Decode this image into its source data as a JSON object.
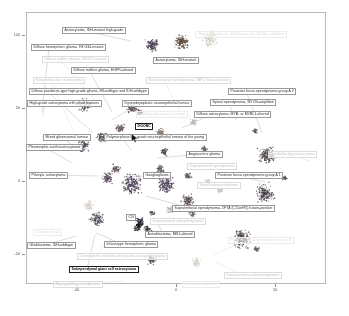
{
  "figure": {
    "type": "scatter-umap",
    "background": "#ffffff",
    "frame_color": "#b9b9b9"
  },
  "chart_data": {
    "type": "scatter",
    "title": "",
    "xlabel": "",
    "ylabel": "",
    "xlim": [
      -75,
      75
    ],
    "ylim": [
      -70,
      115
    ],
    "grid": false,
    "legend": "none",
    "xticks": [
      "-50",
      "0",
      "50"
    ],
    "yticks": [
      "100",
      "50",
      "0",
      "-50"
    ],
    "clusters": [
      {
        "name": "Astrocytoma, IDH-mutant high-grade",
        "x": -12,
        "y": 93,
        "color": "#4a3f52",
        "n": 120,
        "spread": 7
      },
      {
        "name": "Astrocytoma, IDH-mutant",
        "x": 3,
        "y": 95,
        "color": "#5b4a3e",
        "n": 130,
        "spread": 8
      },
      {
        "name": "Oligodendroglioma, IDH-mutant and 1p/19q-codeleted",
        "x": 17,
        "y": 97,
        "color": "#c9c2b4",
        "n": 110,
        "spread": 8
      },
      {
        "name": "Diffuse hemispheric glioma, H3 G34-mutant",
        "x": -46,
        "y": 52,
        "color": "#4d4150",
        "n": 95,
        "spread": 7
      },
      {
        "name": "Diffuse midline glioma, H3 K27-altered",
        "x": -22,
        "y": 50,
        "color": "#5f5158",
        "n": 85,
        "spread": 6
      },
      {
        "name": "Diffuse midline glioma, EGFR-altered",
        "x": -18,
        "y": 47,
        "color": "#6d5a5f",
        "n": 40,
        "spread": 3
      },
      {
        "name": "Extraventricular neurocytoma",
        "x": -28,
        "y": 36,
        "color": "#6a5b66",
        "n": 60,
        "spread": 5
      },
      {
        "name": "Diffuse paediatric-type high-grade glioma, H3-wildtype and IDH-wildtype",
        "x": -37,
        "y": 30,
        "color": "#564a58",
        "n": 70,
        "spread": 6
      },
      {
        "name": "High-grade astrocytoma with piloid features",
        "x": -47,
        "y": 24,
        "color": "#4e4354",
        "n": 90,
        "spread": 7
      },
      {
        "name": "Dysembryoplastic neuroepithelial tumour",
        "x": -8,
        "y": 33,
        "color": "#7a6a5e",
        "n": 55,
        "spread": 5
      },
      {
        "name": "Papillary glioneuronal tumour",
        "x": 2,
        "y": 30,
        "color": "#d6cfc4",
        "n": 35,
        "spread": 4
      },
      {
        "name": "DGONC",
        "x": -6,
        "y": 20,
        "color": "#4a4050",
        "n": 45,
        "spread": 4
      },
      {
        "name": "Supratentorial ependymoma, YAP1 fusion-positive",
        "x": 9,
        "y": 40,
        "color": "#bdb5ad",
        "n": 40,
        "spread": 4
      },
      {
        "name": "Diffuse astrocytoma, MYB- or MYBL1-altered",
        "x": 14,
        "y": 22,
        "color": "#6c5f5a",
        "n": 35,
        "spread": 4
      },
      {
        "name": "Spinal ependymoma, MYCN-amplified",
        "x": 40,
        "y": 34,
        "color": "#5d5150",
        "n": 30,
        "spread": 3
      },
      {
        "name": "Posterior fossa ependymoma group A 2",
        "x": 46,
        "y": 18,
        "color": "#4f4549",
        "n": 160,
        "spread": 10
      },
      {
        "name": "Mixed glioneuronal tumour",
        "x": -30,
        "y": 8,
        "color": "#5d4f5c",
        "n": 55,
        "spread": 5
      },
      {
        "name": "Polymorphous low-grade neuroepithelial tumour of the young",
        "x": -8,
        "y": 8,
        "color": "#6a5a63",
        "n": 50,
        "spread": 5
      },
      {
        "name": "Pleomorphic xanthoastrocytoma",
        "x": -34,
        "y": 2,
        "color": "#5a4e5a",
        "n": 80,
        "spread": 6
      },
      {
        "name": "Pilocytic astrocytoma",
        "x": -22,
        "y": -2,
        "color": "#50455a",
        "n": 200,
        "spread": 11
      },
      {
        "name": "Ganglioglioma",
        "x": -5,
        "y": -3,
        "color": "#4b4158",
        "n": 150,
        "spread": 9
      },
      {
        "name": "Angiocentric glioma",
        "x": 6,
        "y": 3,
        "color": "#635660",
        "n": 45,
        "spread": 4
      },
      {
        "name": "Supratentorial ependymoma",
        "x": 16,
        "y": -1,
        "color": "#cfc7bd",
        "n": 40,
        "spread": 4
      },
      {
        "name": "Cerebellar liponeurocytoma",
        "x": 55,
        "y": 2,
        "color": "#5b4f54",
        "n": 25,
        "spread": 3
      },
      {
        "name": "Posterior fossa ependymoma group A 1",
        "x": 45,
        "y": -9,
        "color": "#473e48",
        "n": 170,
        "spread": 11
      },
      {
        "name": "Spinal subependymoma",
        "x": 22,
        "y": -7,
        "color": "#c6beb6",
        "n": 30,
        "spread": 3
      },
      {
        "name": "Supratentorial ependymoma, ZFTA (C11orf95) fusion-positive",
        "x": 6,
        "y": -14,
        "color": "#5a4d56",
        "n": 90,
        "spread": 7
      },
      {
        "name": "Supratentorial subependymoma",
        "x": -3,
        "y": -20,
        "color": "#b9b1aa",
        "n": 35,
        "spread": 4
      },
      {
        "name": "Astroblastoma, MN1-altered",
        "x": 8,
        "y": -22,
        "color": "#564a52",
        "n": 35,
        "spread": 4
      },
      {
        "name": "CN",
        "x": -12,
        "y": -22,
        "color": "#655763",
        "n": 30,
        "spread": 3
      },
      {
        "name": "Choroid plexus",
        "x": -44,
        "y": -17,
        "color": "#d8d1c8",
        "n": 70,
        "spread": 6
      },
      {
        "name": "Glioblastoma, IDH-wildtype",
        "x": -40,
        "y": -26,
        "color": "#4c4352",
        "n": 110,
        "spread": 8
      },
      {
        "name": "Infant-type hemispheric glioma",
        "x": -18,
        "y": -28,
        "color": "#2d2833",
        "n": 60,
        "spread": 5
      },
      {
        "name": "Desmoplastic infantile astrocytoma and ganglioglioma",
        "x": -14,
        "y": -33,
        "color": "#433a45",
        "n": 45,
        "spread": 4
      },
      {
        "name": "Subependymal giant cell astrocytoma",
        "x": -19,
        "y": -31,
        "color": "#1c1820",
        "n": 70,
        "spread": 5
      },
      {
        "name": "Posterior fossa ependymoma group B",
        "x": 33,
        "y": -40,
        "color": "#4a404a",
        "n": 150,
        "spread": 10
      },
      {
        "name": "Posterior fossa subependymoma",
        "x": 41,
        "y": -47,
        "color": "#6a5d60",
        "n": 30,
        "spread": 3
      },
      {
        "name": "Myxopapillary ependymoma",
        "x": -12,
        "y": -55,
        "color": "#544a52",
        "n": 55,
        "spread": 5
      },
      {
        "name": "Spinal ependymoma",
        "x": 10,
        "y": -56,
        "color": "#d2cbc2",
        "n": 50,
        "spread": 5
      }
    ]
  },
  "labels": [
    {
      "id": "astro-idh-mut-hg",
      "text": "Astrocytoma, IDH-mutant high-grade",
      "x": 62,
      "y": 27,
      "style": "normal",
      "anchor": [
        131,
        41
      ]
    },
    {
      "id": "oligodendroglioma",
      "text": "Oligodendroglioma, IDH-mutant and 1p/19q-codeleted",
      "x": 195,
      "y": 31,
      "style": "vfaded",
      "anchor": null
    },
    {
      "id": "astro-idh-mut",
      "text": "Astrocytoma, IDH-mutant",
      "x": 153,
      "y": 57,
      "style": "normal",
      "anchor": null
    },
    {
      "id": "dhg-g34",
      "text": "Diffuse hemispheric glioma, H3 G34-mutant",
      "x": 31,
      "y": 44,
      "style": "normal",
      "anchor": [
        42,
        112
      ]
    },
    {
      "id": "dmg-k27",
      "text": "Diffuse midline glioma, H3 K27-altered",
      "x": 42,
      "y": 56,
      "style": "faded",
      "anchor": [
        105,
        112
      ]
    },
    {
      "id": "dmg-egfr",
      "text": "Diffuse midline glioma, EGFR-altered",
      "x": 71,
      "y": 67,
      "style": "normal",
      "anchor": [
        112,
        112
      ]
    },
    {
      "id": "evn",
      "text": "Extraventricular neurocytoma",
      "x": 33,
      "y": 77,
      "style": "faded",
      "anchor": [
        74,
        133
      ]
    },
    {
      "id": "st-epn-yap1",
      "text": "Supratentorial ependymoma, YAP1 fusion-positive",
      "x": 146,
      "y": 77,
      "style": "faded",
      "anchor": [
        186,
        123
      ]
    },
    {
      "id": "dphgg",
      "text": "Diffuse paediatric-type high-grade glioma, H3-wildtype and IDH-wildtype",
      "x": 29,
      "y": 88,
      "style": "normal",
      "anchor": [
        93,
        133
      ]
    },
    {
      "id": "pfa2",
      "text": "Posterior fossa ependymoma group A 2",
      "x": 228,
      "y": 88,
      "style": "normal",
      "anchor": [
        262,
        133
      ]
    },
    {
      "id": "hgap",
      "text": "High-grade astrocytoma with piloid features",
      "x": 27,
      "y": 100,
      "style": "normal",
      "anchor": [
        43,
        116
      ]
    },
    {
      "id": "dnet",
      "text": "Dysembryoplastic neuroepithelial tumour",
      "x": 122,
      "y": 100,
      "style": "normal",
      "anchor": [
        112,
        120
      ]
    },
    {
      "id": "spinal-epn-mycn",
      "text": "Spinal ependymoma, MYCN-amplified",
      "x": 210,
      "y": 99,
      "style": "normal",
      "anchor": [
        236,
        120
      ]
    },
    {
      "id": "pgnt",
      "text": "Papillary glioneuronal tumour",
      "x": 136,
      "y": 111,
      "style": "vfaded",
      "anchor": null
    },
    {
      "id": "diffuse-astro-myb",
      "text": "Diffuse astrocytoma, MYB- or MYBL1-altered",
      "x": 194,
      "y": 111,
      "style": "normal",
      "anchor": [
        182,
        128
      ]
    },
    {
      "id": "dgonc",
      "text": "DGONC",
      "x": 135,
      "y": 123,
      "style": "bold",
      "anchor": [
        150,
        131
      ]
    },
    {
      "id": "mixed-gnt",
      "text": "Mixed glioneuronal tumour",
      "x": 43,
      "y": 134,
      "style": "normal",
      "anchor": [
        82,
        152
      ]
    },
    {
      "id": "plnty",
      "text": "Polymorphous low-grade neuroepithelial tumour of the young",
      "x": 104,
      "y": 134,
      "style": "normal",
      "anchor": [
        131,
        150
      ]
    },
    {
      "id": "pxa",
      "text": "Pleomorphic xanthoastrocytoma",
      "x": 26,
      "y": 144,
      "style": "normal",
      "anchor": [
        72,
        163
      ]
    },
    {
      "id": "angiocentric",
      "text": "Angiocentric glioma",
      "x": 186,
      "y": 151,
      "style": "normal",
      "anchor": [
        157,
        158
      ]
    },
    {
      "id": "cerebellar-lipo",
      "text": "Cerebellar liponeurocytoma",
      "x": 268,
      "y": 151,
      "style": "faded",
      "anchor": [
        310,
        161
      ]
    },
    {
      "id": "st-epn",
      "text": "Supratentorial ependymoma",
      "x": 187,
      "y": 163,
      "style": "faded",
      "anchor": null
    },
    {
      "id": "ganglioglioma",
      "text": "Ganglioglioma",
      "x": 143,
      "y": 172,
      "style": "normal",
      "anchor": [
        126,
        177
      ]
    },
    {
      "id": "pilocytic",
      "text": "Pilocytic astrocytoma",
      "x": 29,
      "y": 172,
      "style": "normal",
      "anchor": [
        98,
        176
      ]
    },
    {
      "id": "pfa1",
      "text": "Posterior fossa ependymoma group A 1",
      "x": 215,
      "y": 172,
      "style": "normal",
      "anchor": [
        265,
        182
      ]
    },
    {
      "id": "spinal-subepn",
      "text": "Spinal subependymoma",
      "x": 197,
      "y": 182,
      "style": "faded",
      "anchor": null
    },
    {
      "id": "st-epn-zfta",
      "text": "Supratentorial ependymoma, ZFTA (C11orf95) fusion-positive",
      "x": 172,
      "y": 205,
      "style": "normal",
      "anchor": [
        146,
        196
      ]
    },
    {
      "id": "st-subepn",
      "text": "Supratentorial subependymoma",
      "x": 150,
      "y": 218,
      "style": "faded",
      "anchor": null
    },
    {
      "id": "cn",
      "text": "CN",
      "x": 126,
      "y": 214,
      "style": "normal",
      "anchor": null
    },
    {
      "id": "astroblastoma",
      "text": "Astroblastoma, MN1-altered",
      "x": 145,
      "y": 231,
      "style": "normal",
      "anchor": [
        158,
        224
      ]
    },
    {
      "id": "choroid",
      "text": "Choroid plexus",
      "x": 33,
      "y": 229,
      "style": "vfaded",
      "anchor": null
    },
    {
      "id": "gbm",
      "text": "Glioblastoma, IDH-wildtype",
      "x": 27,
      "y": 242,
      "style": "normal",
      "anchor": [
        76,
        236
      ]
    },
    {
      "id": "infant-hemi",
      "text": "Infant-type hemispheric glioma",
      "x": 104,
      "y": 241,
      "style": "normal",
      "anchor": [
        96,
        233
      ]
    },
    {
      "id": "pf-epn-b",
      "text": "Posterior fossa ependymoma group B",
      "x": 228,
      "y": 237,
      "style": "vfaded",
      "anchor": [
        214,
        255
      ]
    },
    {
      "id": "diag",
      "text": "Desmoplastic infantile astrocytoma and ganglioglioma",
      "x": 77,
      "y": 253,
      "style": "faded",
      "anchor": [
        110,
        239
      ]
    },
    {
      "id": "segca",
      "text": "Subependymal giant cell astrocytoma",
      "x": 69,
      "y": 266,
      "style": "bold",
      "anchor": [
        95,
        235
      ]
    },
    {
      "id": "pf-subepn",
      "text": "Posterior fossa subependymoma",
      "x": 224,
      "y": 272,
      "style": "faded",
      "anchor": [
        216,
        262
      ]
    },
    {
      "id": "myxopapillary",
      "text": "Myxopapillary ependymoma",
      "x": 53,
      "y": 281,
      "style": "faded",
      "anchor": [
        124,
        281
      ]
    },
    {
      "id": "spinal-epn",
      "text": "Spinal ependymoma",
      "x": 182,
      "y": 281,
      "style": "vfaded",
      "anchor": null
    }
  ],
  "cursor": {
    "x": 131,
    "y": 133,
    "name": "mouse-pointer"
  }
}
